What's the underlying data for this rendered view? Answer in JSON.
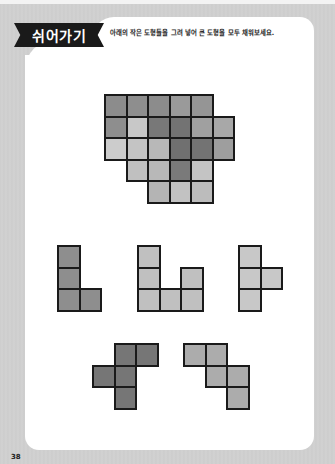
{
  "header": {
    "badge_label": "쉬어가기",
    "instruction": "아래의 작은 도형들을 그려 넣어 큰 도형을 모두 채워보세요."
  },
  "puzzle": {
    "target_shape": {
      "name": "big-shape",
      "cells": [
        {
          "r": 0,
          "c": 0,
          "color": "#8c8c8c"
        },
        {
          "r": 0,
          "c": 1,
          "color": "#8e8e8e"
        },
        {
          "r": 0,
          "c": 2,
          "color": "#8c8c8c"
        },
        {
          "r": 0,
          "c": 3,
          "color": "#9a9a9a"
        },
        {
          "r": 0,
          "c": 4,
          "color": "#959595"
        },
        {
          "r": 1,
          "c": 0,
          "color": "#8e8e8e"
        },
        {
          "r": 1,
          "c": 1,
          "color": "#c8c8c8"
        },
        {
          "r": 1,
          "c": 2,
          "color": "#787878"
        },
        {
          "r": 1,
          "c": 3,
          "color": "#737373"
        },
        {
          "r": 1,
          "c": 4,
          "color": "#a0a0a0"
        },
        {
          "r": 1,
          "c": 5,
          "color": "#a8a8a8"
        },
        {
          "r": 2,
          "c": 0,
          "color": "#cccccc"
        },
        {
          "r": 2,
          "c": 1,
          "color": "#c4c4c4"
        },
        {
          "r": 2,
          "c": 2,
          "color": "#b8b8b8"
        },
        {
          "r": 2,
          "c": 3,
          "color": "#707070"
        },
        {
          "r": 2,
          "c": 4,
          "color": "#737373"
        },
        {
          "r": 2,
          "c": 5,
          "color": "#9e9e9e"
        },
        {
          "r": 3,
          "c": 1,
          "color": "#c0c0c0"
        },
        {
          "r": 3,
          "c": 2,
          "color": "#b8b8b8"
        },
        {
          "r": 3,
          "c": 3,
          "color": "#7a7a7a"
        },
        {
          "r": 3,
          "c": 4,
          "color": "#c4c4c4"
        },
        {
          "r": 4,
          "c": 2,
          "color": "#b4b4b4"
        },
        {
          "r": 4,
          "c": 3,
          "color": "#c2c2c2"
        },
        {
          "r": 4,
          "c": 4,
          "color": "#bcbcbc"
        }
      ]
    },
    "pieces": [
      {
        "name": "piece-l",
        "color": "#8e8e8e",
        "cells": [
          [
            0,
            0
          ],
          [
            1,
            0
          ],
          [
            2,
            0
          ],
          [
            2,
            1
          ]
        ]
      },
      {
        "name": "piece-u",
        "color": "#c0c0c0",
        "cells": [
          [
            0,
            0
          ],
          [
            1,
            0
          ],
          [
            2,
            0
          ],
          [
            2,
            1
          ],
          [
            2,
            2
          ],
          [
            1,
            2
          ]
        ]
      },
      {
        "name": "piece-t",
        "color": "#c8c8c8",
        "cells": [
          [
            0,
            0
          ],
          [
            1,
            0
          ],
          [
            2,
            0
          ],
          [
            1,
            1
          ]
        ]
      },
      {
        "name": "piece-cross-corner",
        "color": "#767676",
        "cells": [
          [
            0,
            1
          ],
          [
            0,
            2
          ],
          [
            1,
            0
          ],
          [
            1,
            1
          ],
          [
            2,
            1
          ]
        ]
      },
      {
        "name": "piece-stairs",
        "color": "#acacac",
        "cells": [
          [
            0,
            0
          ],
          [
            0,
            1
          ],
          [
            1,
            1
          ],
          [
            1,
            2
          ],
          [
            2,
            2
          ]
        ]
      }
    ]
  },
  "footer": {
    "page_number": "38"
  }
}
